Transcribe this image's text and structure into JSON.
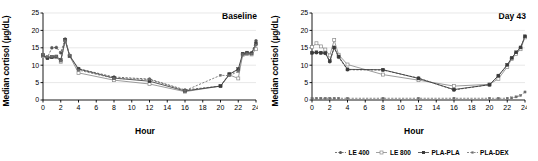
{
  "figure": {
    "ylabel": "Median cortisol (µg/dL)",
    "xlabel": "Hour"
  },
  "panels": [
    {
      "tag": "Baseline"
    },
    {
      "tag": "Day 43"
    }
  ],
  "legend": {
    "items": [
      {
        "label": "LE 400",
        "marker": "filled-circle",
        "dash": "dashed",
        "color": "#555555"
      },
      {
        "label": "LE 800",
        "marker": "open-square",
        "dash": "solid",
        "color": "#8a8a8a"
      },
      {
        "label": "PLA-PLA",
        "marker": "filled-square",
        "dash": "solid",
        "color": "#3a3a3a"
      },
      {
        "label": "PLA-DEX",
        "marker": "small-square",
        "dash": "dashed",
        "color": "#6e6e6e"
      }
    ]
  },
  "axes": {
    "ylim": [
      0,
      25
    ],
    "yticks": [
      0,
      5,
      10,
      15,
      20,
      25
    ],
    "xlim": [
      0,
      24
    ],
    "xticks": [
      0,
      2,
      4,
      6,
      8,
      10,
      12,
      14,
      16,
      18,
      20,
      22,
      24
    ],
    "grid": "horizontal"
  },
  "chart_data": [
    {
      "type": "line",
      "title": "Baseline",
      "xlabel": "Hour",
      "ylabel": "Median cortisol (µg/dL)",
      "xlim": [
        0,
        24
      ],
      "ylim": [
        0,
        25
      ],
      "xticks": [
        0,
        2,
        4,
        6,
        8,
        10,
        12,
        14,
        16,
        18,
        20,
        22,
        24
      ],
      "yticks": [
        0,
        5,
        10,
        15,
        20,
        25
      ],
      "grid": "horizontal",
      "legend_position": "below-figure",
      "x": [
        0,
        0.5,
        1,
        1.5,
        2,
        2.5,
        3,
        4,
        8,
        12,
        16,
        20,
        21,
        22,
        22.5,
        23,
        23.5,
        24
      ],
      "series": [
        {
          "name": "LE 400",
          "values": [
            13.0,
            12.2,
            15.0,
            15.1,
            13.6,
            17.5,
            12.8,
            9.0,
            6.6,
            6.0,
            2.9,
            4.0,
            7.5,
            8.6,
            13.2,
            13.4,
            13.5,
            17.0
          ]
        },
        {
          "name": "LE 800",
          "values": [
            12.6,
            12.3,
            12.4,
            12.3,
            11.0,
            17.2,
            12.6,
            7.8,
            5.7,
            4.6,
            2.4,
            4.0,
            7.2,
            6.2,
            13.0,
            13.2,
            13.1,
            14.6
          ]
        },
        {
          "name": "PLA-PLA",
          "values": [
            12.9,
            12.0,
            12.3,
            12.5,
            11.5,
            17.3,
            12.7,
            8.9,
            6.3,
            5.4,
            2.6,
            4.0,
            7.4,
            8.9,
            13.3,
            13.6,
            13.4,
            16.2
          ]
        },
        {
          "name": "PLA-DEX",
          "values": [
            13.1,
            12.4,
            12.5,
            12.6,
            11.2,
            17.0,
            12.9,
            8.6,
            6.2,
            5.9,
            2.7,
            7.1,
            7.0,
            8.2,
            13.1,
            13.3,
            13.2,
            15.8
          ]
        }
      ]
    },
    {
      "type": "line",
      "title": "Day 43",
      "xlabel": "Hour",
      "ylabel": "Median cortisol (µg/dL)",
      "xlim": [
        0,
        24
      ],
      "ylim": [
        0,
        25
      ],
      "xticks": [
        0,
        2,
        4,
        6,
        8,
        10,
        12,
        14,
        16,
        18,
        20,
        22,
        24
      ],
      "yticks": [
        0,
        5,
        10,
        15,
        20,
        25
      ],
      "grid": "horizontal",
      "legend_position": "below-figure",
      "x": [
        0,
        0.5,
        1,
        1.5,
        2,
        2.5,
        3,
        4,
        8,
        12,
        16,
        20,
        21,
        22,
        22.5,
        23,
        23.5,
        24
      ],
      "series": [
        {
          "name": "LE 400",
          "values": [
            13.5,
            13.6,
            13.5,
            13.4,
            11.0,
            15.0,
            12.3,
            8.7,
            8.6,
            6.3,
            2.9,
            4.4,
            6.9,
            10.0,
            12.0,
            13.6,
            15.0,
            18.2
          ]
        },
        {
          "name": "LE 800",
          "values": [
            15.2,
            16.3,
            15.4,
            14.5,
            12.8,
            17.2,
            13.0,
            10.2,
            7.3,
            5.7,
            4.0,
            4.5,
            6.1,
            9.5,
            11.8,
            13.2,
            14.6,
            18.0
          ]
        },
        {
          "name": "PLA-PLA",
          "values": [
            13.6,
            13.7,
            13.6,
            13.5,
            11.2,
            15.1,
            12.5,
            8.8,
            8.7,
            6.2,
            3.0,
            4.4,
            7.0,
            10.1,
            12.1,
            13.7,
            15.1,
            18.3
          ]
        },
        {
          "name": "PLA-DEX",
          "values": [
            0.5,
            0.5,
            0.5,
            0.5,
            0.5,
            0.5,
            0.5,
            0.5,
            0.5,
            0.5,
            0.5,
            0.5,
            0.5,
            0.5,
            0.6,
            0.9,
            1.3,
            2.3
          ]
        }
      ]
    }
  ]
}
